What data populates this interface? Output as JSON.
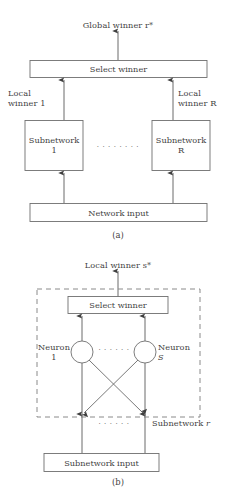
{
  "figure": {
    "panels": [
      {
        "id": "a",
        "caption": "(a)",
        "top_label": "Global winner r*",
        "select_box": "Select winner",
        "left_edge_label": "Local\nwinner 1",
        "right_edge_label": "Local\nwinner R",
        "left_node": "Subnetwork\n1",
        "right_node": "Subnetwork\nR",
        "ellipsis": "· · · · · · · ·",
        "bottom_box": "Network input"
      },
      {
        "id": "b",
        "caption": "(b)",
        "top_label": "Local winner s*",
        "select_box": "Select winner",
        "left_neuron": "Neuron\n1",
        "right_neuron_line1": "Neuron",
        "right_neuron_line2": "S",
        "neuron_ellipsis": "· · · · · ·",
        "input_ellipsis": "· · · · · ·",
        "boundary_label_prefix": "Subnetwork ",
        "boundary_label_var": "r",
        "bottom_box": "Subnetwork input"
      }
    ]
  },
  "style": {
    "stroke": "#4a4a4a",
    "dashed_stroke": "#7a7a7a",
    "background": "#ffffff",
    "text": "#3f3f3f"
  }
}
